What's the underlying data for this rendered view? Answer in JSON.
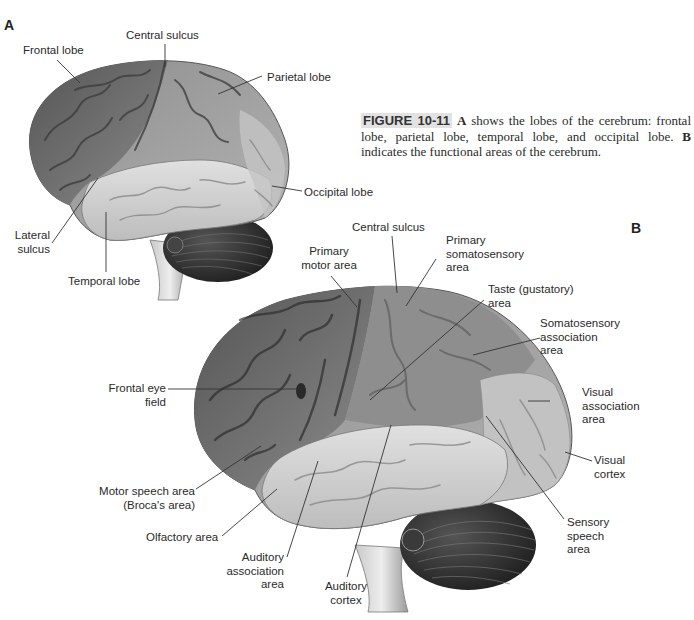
{
  "panel_a": {
    "letter": "A",
    "labels": {
      "frontal_lobe": "Frontal lobe",
      "central_sulcus": "Central sulcus",
      "parietal_lobe": "Parietal lobe",
      "occipital_lobe": "Occipital lobe",
      "lateral_sulcus_1": "Lateral",
      "lateral_sulcus_2": "sulcus",
      "temporal_lobe": "Temporal lobe"
    }
  },
  "caption": {
    "figure_id": "FIGURE 10-11",
    "panel_a_ref": "A",
    "text_1": " shows the lobes of the cerebrum: frontal lobe, parietal lobe, temporal lobe, and occipital lobe. ",
    "panel_b_ref": "B",
    "text_2": " indicates the functional areas of the cerebrum."
  },
  "panel_b": {
    "letter": "B",
    "labels": {
      "central_sulcus": "Central sulcus",
      "primary_motor_1": "Primary",
      "primary_motor_2": "motor area",
      "primary_somato_1": "Primary",
      "primary_somato_2": "somatosensory",
      "primary_somato_3": "area",
      "taste_1": "Taste (gustatory)",
      "taste_2": "area",
      "somato_assoc_1": "Somatosensory",
      "somato_assoc_2": "association",
      "somato_assoc_3": "area",
      "frontal_eye_1": "Frontal eye",
      "frontal_eye_2": "field",
      "visual_assoc_1": "Visual",
      "visual_assoc_2": "association",
      "visual_assoc_3": "area",
      "visual_cortex_1": "Visual",
      "visual_cortex_2": "cortex",
      "motor_speech_1": "Motor speech area",
      "motor_speech_2": "(Broca's area)",
      "sensory_speech_1": "Sensory",
      "sensory_speech_2": "speech",
      "sensory_speech_3": "area",
      "olfactory": "Olfactory area",
      "auditory_assoc_1": "Auditory",
      "auditory_assoc_2": "association",
      "auditory_assoc_3": "area",
      "auditory_cortex_1": "Auditory",
      "auditory_cortex_2": "cortex"
    }
  },
  "colors": {
    "frontal_dark": "#6e6e6e",
    "parietal_mid": "#9a9a9a",
    "temporal_light": "#d4d4d4",
    "occipital_light": "#c2c2c2",
    "cerebellum": "#2e2e2e",
    "caption_highlight": "#e2e2e2"
  }
}
